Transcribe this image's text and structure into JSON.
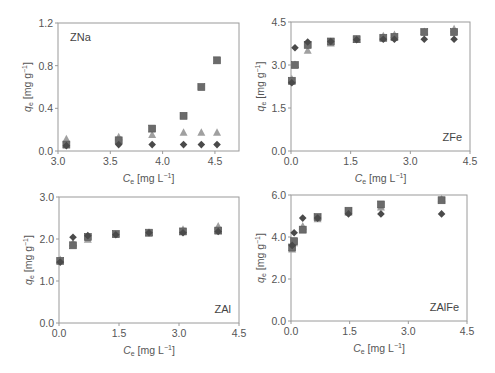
{
  "chart_data": [
    {
      "type": "scatter",
      "panel": "ZNa",
      "title": "",
      "annotation": "ZNa",
      "xlabel": "C_e [mg L^-1]",
      "ylabel": "q_e [mg g^-1]",
      "xlim": [
        3.0,
        4.73
      ],
      "ylim": [
        0,
        1.2
      ],
      "xticks": [
        "3.0",
        "3.5",
        "4.0",
        "4.5"
      ],
      "yticks": [
        "0.0",
        "0.4",
        "0.8",
        "1.2"
      ],
      "grid": false,
      "series": [
        {
          "name": "square",
          "marker": "square",
          "x": [
            3.08,
            3.58,
            3.9,
            4.2,
            4.37,
            4.52
          ],
          "y": [
            0.06,
            0.1,
            0.21,
            0.33,
            0.6,
            0.85
          ]
        },
        {
          "name": "triangle",
          "marker": "triangle",
          "x": [
            3.08,
            3.58,
            3.9,
            4.2,
            4.37,
            4.52
          ],
          "y": [
            0.11,
            0.13,
            0.15,
            0.17,
            0.17,
            0.17
          ]
        },
        {
          "name": "diamond",
          "marker": "diamond",
          "x": [
            3.08,
            3.58,
            3.9,
            4.2,
            4.37,
            4.52
          ],
          "y": [
            0.05,
            0.06,
            0.06,
            0.06,
            0.06,
            0.06
          ]
        }
      ]
    },
    {
      "type": "scatter",
      "panel": "ZFe",
      "annotation": "ZFe",
      "xlabel": "C_e [mg L^-1]",
      "ylabel": "q_e [mg g^-1]",
      "xlim": [
        0,
        4.5
      ],
      "ylim": [
        0,
        4.5
      ],
      "xticks": [
        "0.0",
        "1.5",
        "3.0",
        "4.5"
      ],
      "yticks": [
        "0.0",
        "1.5",
        "3.0",
        "4.5"
      ],
      "grid": false,
      "series": [
        {
          "name": "square",
          "marker": "square",
          "x": [
            0.02,
            0.1,
            0.42,
            1.0,
            1.65,
            2.32,
            2.6,
            3.35,
            4.1
          ],
          "y": [
            2.45,
            3.0,
            3.7,
            3.82,
            3.9,
            3.95,
            3.98,
            4.15,
            4.15
          ]
        },
        {
          "name": "triangle",
          "marker": "triangle",
          "x": [
            0.02,
            0.1,
            0.42,
            1.0,
            1.65,
            2.32,
            2.6,
            3.35,
            4.1
          ],
          "y": [
            2.5,
            3.0,
            3.5,
            3.75,
            3.88,
            4.0,
            4.05,
            4.15,
            4.25
          ]
        },
        {
          "name": "diamond",
          "marker": "diamond",
          "x": [
            0.02,
            0.1,
            0.42,
            1.0,
            1.65,
            2.32,
            2.6,
            3.35,
            4.1
          ],
          "y": [
            2.38,
            3.6,
            3.8,
            3.82,
            3.88,
            3.9,
            3.9,
            3.9,
            3.9
          ]
        }
      ]
    },
    {
      "type": "scatter",
      "panel": "ZAl",
      "annotation": "ZAl",
      "xlabel": "C_e [mg L^-1]",
      "ylabel": "q_e [mg g^-1]",
      "xlim": [
        0,
        4.5
      ],
      "ylim": [
        0,
        3.0
      ],
      "xticks": [
        "0.0",
        "1.5",
        "3.0",
        "4.5"
      ],
      "yticks": [
        "0.0",
        "1.0",
        "2.0",
        "3.0"
      ],
      "grid": false,
      "series": [
        {
          "name": "square",
          "marker": "square",
          "x": [
            0.03,
            0.35,
            0.72,
            1.42,
            2.25,
            3.1,
            3.98
          ],
          "y": [
            1.48,
            1.85,
            2.05,
            2.12,
            2.15,
            2.18,
            2.2
          ]
        },
        {
          "name": "triangle",
          "marker": "triangle",
          "x": [
            0.03,
            0.35,
            0.72,
            1.42,
            2.25,
            3.1,
            3.98
          ],
          "y": [
            1.5,
            1.9,
            1.98,
            2.1,
            2.15,
            2.22,
            2.3
          ]
        },
        {
          "name": "diamond",
          "marker": "diamond",
          "x": [
            0.03,
            0.35,
            0.72,
            1.42,
            2.25,
            3.1,
            3.98
          ],
          "y": [
            1.45,
            2.04,
            2.08,
            2.1,
            2.15,
            2.15,
            2.18
          ]
        }
      ]
    },
    {
      "type": "scatter",
      "panel": "ZAlFe",
      "annotation": "ZAlFe",
      "xlabel": "C_e [mg L^-1]",
      "ylabel": "q_e [mg g^-1]",
      "xlim": [
        0,
        4.5
      ],
      "ylim": [
        0,
        6.0
      ],
      "xticks": [
        "0.0",
        "1.5",
        "3.0",
        "4.5"
      ],
      "yticks": [
        "0.0",
        "2.0",
        "4.0",
        "6.0"
      ],
      "grid": false,
      "series": [
        {
          "name": "square",
          "marker": "square",
          "x": [
            0.03,
            0.08,
            0.3,
            0.68,
            1.47,
            2.3,
            3.85
          ],
          "y": [
            3.5,
            3.8,
            4.35,
            4.95,
            5.25,
            5.55,
            5.75
          ]
        },
        {
          "name": "triangle",
          "marker": "triangle",
          "x": [
            0.03,
            0.08,
            0.3,
            0.68,
            1.47,
            2.3,
            3.85
          ],
          "y": [
            3.4,
            3.7,
            4.5,
            4.85,
            5.15,
            5.4,
            5.8
          ]
        },
        {
          "name": "diamond",
          "marker": "diamond",
          "x": [
            0.03,
            0.08,
            0.3,
            0.68,
            1.47,
            2.3,
            3.85
          ],
          "y": [
            3.6,
            4.2,
            4.9,
            4.9,
            5.1,
            5.1,
            5.1
          ]
        }
      ]
    }
  ],
  "panels": [
    {
      "id": "ZNa",
      "box": [
        58,
        23,
        239,
        151
      ]
    },
    {
      "id": "ZFe",
      "box": [
        291,
        22,
        470,
        151
      ]
    },
    {
      "id": "ZAl",
      "box": [
        59,
        197,
        239,
        323
      ]
    },
    {
      "id": "ZAlFe",
      "box": [
        291,
        195,
        467,
        321
      ]
    }
  ],
  "axis_text": {
    "x_var": "C",
    "x_sub": "e",
    "x_unit": " [mg L",
    "x_sup": "−1",
    "x_close": "]",
    "y_var": "q",
    "y_sub": "e",
    "y_unit": " [mg g",
    "y_sup": "−1",
    "y_close": "]"
  },
  "colors": {
    "frame": "#9a9a9a",
    "square": "#6b6b6b",
    "triangle": "#a0a0a0",
    "diamond": "#4a4a4a",
    "text": "#555555"
  }
}
